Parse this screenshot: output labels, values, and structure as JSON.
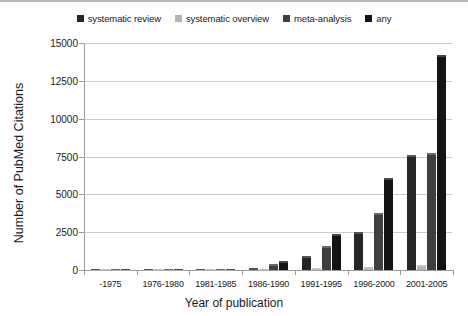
{
  "chart_data": {
    "type": "bar",
    "title": "",
    "xlabel": "Year of publication",
    "ylabel": "Number of PubMed Citations",
    "ylim": [
      0,
      15000
    ],
    "ytick_step": 2500,
    "yticks": [
      "0",
      "2500",
      "5000",
      "7500",
      "10000",
      "12500",
      "15000"
    ],
    "grid": true,
    "legend_position": "top-center",
    "categories": [
      "-1975",
      "1976-1980",
      "1981-1985",
      "1986-1990",
      "1991-1995",
      "1996-2000",
      "2001-2005"
    ],
    "series": [
      {
        "name": "systematic review",
        "color": "#262626",
        "values": [
          5,
          10,
          30,
          160,
          900,
          2500,
          7600
        ]
      },
      {
        "name": "systematic overview",
        "color": "#b3b3b3",
        "values": [
          1,
          2,
          5,
          20,
          120,
          180,
          320
        ]
      },
      {
        "name": "meta-analysis",
        "color": "#3f3f3f",
        "values": [
          4,
          15,
          60,
          420,
          1600,
          3800,
          7700
        ]
      },
      {
        "name": "any",
        "color": "#141414",
        "values": [
          8,
          25,
          90,
          570,
          2400,
          6100,
          14200
        ]
      }
    ]
  }
}
